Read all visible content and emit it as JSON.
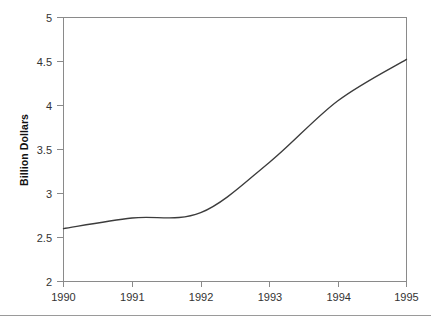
{
  "chart_data": {
    "type": "line",
    "title": "",
    "subtitle": "",
    "xlabel": "",
    "ylabel": "Billion Dollars",
    "x": [
      1990,
      1991,
      1992,
      1993,
      1994,
      1995
    ],
    "categories": [
      "1990",
      "1991",
      "1992",
      "1993",
      "1994",
      "1995"
    ],
    "values": [
      2.6,
      2.72,
      2.78,
      3.35,
      4.05,
      4.52
    ],
    "series": [
      {
        "name": "",
        "values": [
          2.6,
          2.72,
          2.78,
          3.35,
          4.05,
          4.52
        ]
      }
    ],
    "xlim": [
      1990,
      1995
    ],
    "ylim": [
      2,
      5
    ],
    "ytick_labels": [
      "2",
      "2.5",
      "3",
      "3.5",
      "4",
      "4.5",
      "5"
    ],
    "ytick_values": [
      2,
      2.5,
      3,
      3.5,
      4,
      4.5,
      5
    ],
    "xtick_labels": [
      "1990",
      "1991",
      "1992",
      "1993",
      "1994",
      "1995"
    ],
    "grid": false,
    "legend": false,
    "legend_position": "none",
    "line_color": "#3c3c3c",
    "axis_color": "#8a8a8a"
  },
  "axis": {
    "y_title": "Billion Dollars",
    "y_ticks": [
      {
        "label": "5",
        "value": 5
      },
      {
        "label": "4.5",
        "value": 4.5
      },
      {
        "label": "4",
        "value": 4
      },
      {
        "label": "3.5",
        "value": 3.5
      },
      {
        "label": "3",
        "value": 3
      },
      {
        "label": "2.5",
        "value": 2.5
      },
      {
        "label": "2",
        "value": 2
      }
    ],
    "x_ticks": [
      {
        "label": "1990",
        "value": 1990
      },
      {
        "label": "1991",
        "value": 1991
      },
      {
        "label": "1992",
        "value": 1992
      },
      {
        "label": "1993",
        "value": 1993
      },
      {
        "label": "1994",
        "value": 1994
      },
      {
        "label": "1995",
        "value": 1995
      }
    ]
  }
}
